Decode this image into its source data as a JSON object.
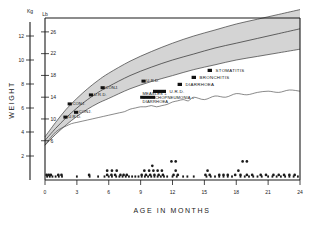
{
  "chart_data": {
    "type": "line",
    "title": "",
    "xlabel": "AGE IN MONTHS",
    "ylabel": "WEIGHT",
    "unit_left": "Kg",
    "unit_right": "Lb",
    "xlim": [
      0,
      24
    ],
    "ylim_kg": [
      0,
      13.5
    ],
    "grid": false,
    "xticks": [
      "0",
      "3",
      "6",
      "9",
      "12",
      "15",
      "18",
      "21",
      "24"
    ],
    "xtick_values": [
      0,
      3,
      6,
      9,
      12,
      15,
      18,
      21,
      24
    ],
    "yticks_kg": [
      "2",
      "4",
      "6",
      "8",
      "10",
      "12"
    ],
    "ytick_values_kg": [
      2,
      4,
      6,
      8,
      10,
      12
    ],
    "yticks_lb": [
      "6",
      "10",
      "14",
      "18",
      "22",
      "26"
    ],
    "ytick_values_lb": [
      6,
      10,
      14,
      18,
      22,
      26
    ],
    "series": [
      {
        "name": "reference-band-upper",
        "note": "upper boundary of shaded normal growth band",
        "x": [
          0,
          1,
          2,
          3,
          4,
          5,
          6,
          8,
          10,
          12,
          14,
          16,
          18,
          20,
          22,
          24
        ],
        "values": [
          3.6,
          4.8,
          5.9,
          6.8,
          7.6,
          8.3,
          8.9,
          9.9,
          10.7,
          11.4,
          12.0,
          12.5,
          13.0,
          13.4,
          13.8,
          14.2
        ]
      },
      {
        "name": "reference-band-median",
        "note": "median reference line drawn inside the band",
        "x": [
          0,
          1,
          2,
          3,
          4,
          5,
          6,
          8,
          10,
          12,
          14,
          16,
          18,
          20,
          22,
          24
        ],
        "values": [
          3.3,
          4.3,
          5.2,
          6.0,
          6.7,
          7.3,
          7.8,
          8.7,
          9.4,
          10.0,
          10.5,
          11.0,
          11.4,
          11.8,
          12.2,
          12.6
        ]
      },
      {
        "name": "reference-band-lower",
        "note": "lower boundary of shaded normal growth band",
        "x": [
          0,
          1,
          2,
          3,
          4,
          5,
          6,
          8,
          10,
          12,
          14,
          16,
          18,
          20,
          22,
          24
        ],
        "values": [
          2.9,
          3.8,
          4.6,
          5.3,
          5.9,
          6.4,
          6.8,
          7.6,
          8.2,
          8.7,
          9.2,
          9.6,
          10.0,
          10.3,
          10.6,
          10.9
        ]
      },
      {
        "name": "patient-weight",
        "note": "observed weight curve of the child",
        "x": [
          0,
          0.5,
          1,
          1.5,
          2,
          2.5,
          3,
          3.5,
          4,
          4.5,
          5,
          5.5,
          6,
          6.5,
          7,
          7.5,
          8,
          8.5,
          9,
          9.5,
          10,
          10.5,
          11,
          11.5,
          12,
          12.5,
          13,
          13.5,
          14,
          15,
          16,
          17,
          18,
          19,
          20,
          21,
          22,
          23,
          24
        ],
        "values": [
          2.9,
          3.5,
          4.0,
          4.3,
          4.5,
          4.7,
          4.8,
          4.9,
          5.0,
          5.1,
          5.2,
          5.3,
          5.4,
          5.5,
          5.6,
          5.7,
          5.9,
          6.0,
          6.1,
          6.1,
          6.2,
          6.1,
          6.2,
          6.3,
          6.5,
          6.6,
          6.7,
          6.6,
          6.9,
          6.7,
          7.0,
          6.9,
          7.2,
          7.1,
          7.3,
          7.4,
          7.3,
          7.5,
          7.4
        ]
      }
    ]
  },
  "axes": {
    "x_title": "AGE IN MONTHS",
    "y_title": "WEIGHT",
    "left_unit": "Kg",
    "right_unit": "Lb"
  },
  "event_labels": [
    {
      "id": "conj-1",
      "text": "CONJ.",
      "x": 3.05,
      "kg": 5.55
    },
    {
      "id": "urd-1",
      "text": "U.R.D.",
      "x": 2.05,
      "kg": 5.15
    },
    {
      "id": "conj-2",
      "text": "CONJ.",
      "x": 2.45,
      "kg": 6.25
    },
    {
      "id": "urd-2",
      "text": "U.R.D.",
      "x": 4.45,
      "kg": 7.0
    },
    {
      "id": "conj-3",
      "text": "CONJ.",
      "x": 5.55,
      "kg": 7.6
    },
    {
      "id": "urd-3",
      "text": "U.R.D.",
      "x": 9.4,
      "kg": 8.15
    },
    {
      "id": "measles",
      "text": "MEASLES +",
      "x": 9.05,
      "kg": 7.1
    },
    {
      "id": "broncho",
      "text": "BRONCHOPNEUMONIA +",
      "x": 9.05,
      "kg": 6.75
    },
    {
      "id": "diarrhoea-2",
      "text": "DIARRHOEA",
      "x": 9.05,
      "kg": 6.4
    }
  ],
  "legend": {
    "items": [
      {
        "id": "stomatitis",
        "label": "STOMATITIS",
        "marker": "filled-square"
      },
      {
        "id": "bronchitis",
        "label": "BRONCHITIS",
        "marker": "filled-square"
      },
      {
        "id": "diarrhoea",
        "label": "DIARRHOEA",
        "marker": "filled-square"
      },
      {
        "id": "urd",
        "label": "U.R.D.",
        "marker": "filled-bar"
      }
    ]
  },
  "visit_dots": {
    "note": "scatter of clinic visit / illness episode marks below the growth curves",
    "rows_kg": [
      1.55,
      1.18,
      0.78,
      0.42
    ],
    "points": [
      {
        "x": 0.15,
        "row": 3
      },
      {
        "x": 0.35,
        "row": 3
      },
      {
        "x": 0.55,
        "row": 3
      },
      {
        "x": 1.25,
        "row": 3
      },
      {
        "x": 1.55,
        "row": 3
      },
      {
        "x": 4.15,
        "row": 3
      },
      {
        "x": 5.85,
        "row": 3
      },
      {
        "x": 6.25,
        "row": 3
      },
      {
        "x": 6.6,
        "row": 3
      },
      {
        "x": 7.1,
        "row": 3
      },
      {
        "x": 7.4,
        "row": 3
      },
      {
        "x": 7.7,
        "row": 3
      },
      {
        "x": 5.85,
        "row": 2
      },
      {
        "x": 6.3,
        "row": 2
      },
      {
        "x": 6.75,
        "row": 2
      },
      {
        "x": 9.1,
        "row": 3
      },
      {
        "x": 9.5,
        "row": 3
      },
      {
        "x": 9.9,
        "row": 3
      },
      {
        "x": 10.3,
        "row": 3
      },
      {
        "x": 10.7,
        "row": 3
      },
      {
        "x": 11.1,
        "row": 3
      },
      {
        "x": 9.35,
        "row": 2
      },
      {
        "x": 9.8,
        "row": 2
      },
      {
        "x": 10.2,
        "row": 2
      },
      {
        "x": 10.6,
        "row": 2
      },
      {
        "x": 11.0,
        "row": 2
      },
      {
        "x": 10.1,
        "row": 1
      },
      {
        "x": 12.1,
        "row": 3
      },
      {
        "x": 12.5,
        "row": 3
      },
      {
        "x": 12.3,
        "row": 2
      },
      {
        "x": 11.9,
        "row": 0
      },
      {
        "x": 12.3,
        "row": 0
      },
      {
        "x": 15.1,
        "row": 3
      },
      {
        "x": 15.5,
        "row": 3
      },
      {
        "x": 15.3,
        "row": 2
      },
      {
        "x": 16.4,
        "row": 3
      },
      {
        "x": 16.8,
        "row": 3
      },
      {
        "x": 17.2,
        "row": 3
      },
      {
        "x": 17.9,
        "row": 3
      },
      {
        "x": 18.4,
        "row": 3
      },
      {
        "x": 18.2,
        "row": 2
      },
      {
        "x": 19.0,
        "row": 3
      },
      {
        "x": 19.5,
        "row": 3
      },
      {
        "x": 18.6,
        "row": 0
      },
      {
        "x": 19.0,
        "row": 0
      },
      {
        "x": 20.3,
        "row": 3
      },
      {
        "x": 20.8,
        "row": 3
      },
      {
        "x": 21.5,
        "row": 3
      },
      {
        "x": 22.0,
        "row": 3
      },
      {
        "x": 22.5,
        "row": 3
      },
      {
        "x": 23.0,
        "row": 3
      },
      {
        "x": 23.5,
        "row": 3
      }
    ]
  },
  "baseline_ticks": {
    "note": "dense tick marks along the baseline indicating visit days",
    "x": [
      0.2,
      0.45,
      0.7,
      1.0,
      1.3,
      1.6,
      3.0,
      4.2,
      5.0,
      5.6,
      6.0,
      6.3,
      6.7,
      7.0,
      7.3,
      7.6,
      7.9,
      8.2,
      8.5,
      8.8,
      9.1,
      9.4,
      9.7,
      10.0,
      10.3,
      10.6,
      10.9,
      11.2,
      11.5,
      12.0,
      12.4,
      13.0,
      13.4,
      14.0,
      15.2,
      15.6,
      16.0,
      16.4,
      16.8,
      17.2,
      17.6,
      18.4,
      18.8,
      19.2,
      19.6,
      20.0,
      20.4,
      21.0,
      21.4,
      21.8,
      22.2,
      22.6,
      23.0,
      23.4,
      23.8
    ]
  }
}
